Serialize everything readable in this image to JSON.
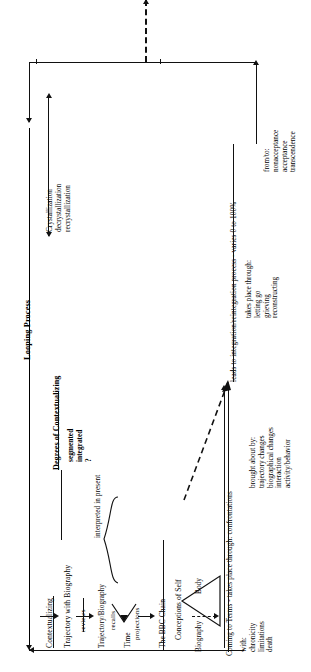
{
  "diagram": {
    "orientation": "rotated-90-ccw",
    "labels": {
      "looping_process": "Looping Process",
      "contextualizing": "Contextualizing",
      "trajectory_with_biography": "Trajectory with Biography",
      "degrees_of_contextualizing": "Degrees of Contextualizing",
      "segmented": "segmented",
      "integrated": "integrated",
      "question_mark": "?",
      "reviews": "reviews",
      "trajectory_biography": "Trajectory/Biography",
      "recalls": "recalls",
      "time": "Time",
      "projections": "projections",
      "interpreted_in_present": "interpreted in present",
      "bbc_chain": "The BBC Chain",
      "conceptions_of_self": "Conceptions of Self",
      "body": "Body",
      "biography": "Biography",
      "coming_to_terms": "Coming to Terms - takes place through: confrontations",
      "with_header": "with:",
      "with_items": [
        "chronicity",
        "limitations",
        "death"
      ],
      "brought_about_header": "brought about by:",
      "brought_about_items": [
        "trajectory changes",
        "biographical changes",
        "interaction",
        "activity/behavior"
      ],
      "crystallization": "Crystallization",
      "decrystallization": "decrystallization",
      "recrystallization": "recrystallization",
      "leads_to_integration": "leads to integration/reintegration process - varies 0 to 100%",
      "takes_place_through_header": "takes place through:",
      "takes_place_through_items": [
        "letting go",
        "grieving",
        "reconstructing"
      ],
      "from_to_header": "from/to:",
      "from_to_items": [
        "nonacceptance",
        "acceptance",
        "transcendence"
      ]
    },
    "colors": {
      "ink": "#111111",
      "paper": "#ffffff"
    }
  }
}
